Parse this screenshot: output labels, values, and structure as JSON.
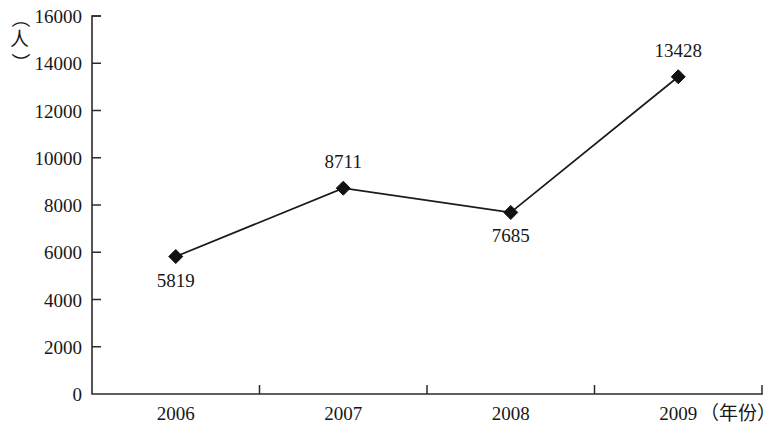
{
  "chart_data": {
    "type": "line",
    "title": "",
    "xlabel": "（年份）",
    "ylabel": "（人）",
    "categories": [
      "2006",
      "2007",
      "2008",
      "2009"
    ],
    "values": [
      5819,
      8711,
      7685,
      13428
    ],
    "series": [
      {
        "name": "人数",
        "values": [
          5819,
          8711,
          7685,
          13428
        ]
      }
    ],
    "value_labels": [
      "5819",
      "8711",
      "7685",
      "13428"
    ],
    "value_label_positions": [
      "below",
      "above",
      "below",
      "above"
    ],
    "ylim": [
      0,
      16000
    ],
    "y_ticks": [
      "0",
      "2000",
      "4000",
      "6000",
      "8000",
      "10000",
      "12000",
      "14000",
      "16000"
    ],
    "y_tick_values": [
      0,
      2000,
      4000,
      6000,
      8000,
      10000,
      12000,
      14000,
      16000
    ],
    "x_ticks": [
      "2006",
      "2007",
      "2008",
      "2009"
    ],
    "grid": false,
    "legend": "none",
    "marker": "diamond",
    "line_color": "#1a1a1a",
    "marker_color": "#111111",
    "axis_color": "#2b2b2b",
    "background_color": "#ffffff"
  },
  "y_axis_unit": {
    "open_paren": "（",
    "glyph": "人",
    "close_paren": "）"
  },
  "x_axis_unit": {
    "text": "（年份）"
  }
}
